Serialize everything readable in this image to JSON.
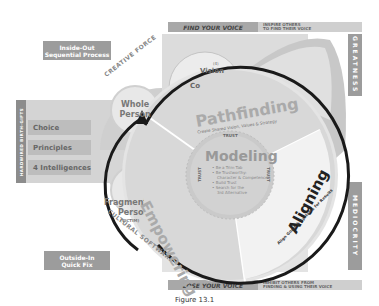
{
  "header": {
    "find_voice": "FIND YOUR VOICE",
    "inspire_line1": "INSPIRE OTHERS",
    "inspire_line2": "TO FIND THEIR VOICE"
  },
  "footer": {
    "lose_voice": "LOSE YOUR VOICE",
    "inhibit_line1": "INHIBIT OTHERS FROM",
    "inhibit_line2": "FINDING & USING THEIR VOICE",
    "caption": "Figure 13.1"
  },
  "left": {
    "inside_out_line1": "Inside-Out",
    "inside_out_line2": "Sequential Process",
    "outside_in_line1": "Outside-In",
    "outside_in_line2": "Quick Fix",
    "hardwired_label": "HARDWIRED BIRTH-GIFTS",
    "gifts": [
      "Choice",
      "Principles",
      "4 Intelligences"
    ],
    "creative_force": "CREATIVE FORCE",
    "cultural_software": "CULTURAL SOFTWARE",
    "whole_person_line1": "Whole",
    "whole_person_line2": "Person",
    "fragmented_line1": "Fragmented",
    "fragmented_line2": "Person",
    "fragmented_note": "(VICTIM)"
  },
  "right": {
    "greatness": "GREATNESS",
    "mediocrity": "MEDIOCRITY"
  },
  "wheel": {
    "vision": "Vision",
    "vision_prefix": "(4)",
    "conscience_partial": "Co",
    "pathfinding": "Pathfinding",
    "pathfinding_sub": "Create Shared Vision, Values & Strategy",
    "empowering": "Empowering",
    "aligning": "Aligning",
    "aligning_sub": "Align Goals & Systems for Results",
    "modeling": "Modeling",
    "trust": "TRUST",
    "modeling_bullets": [
      "Be a Trim Tab",
      "Be Trustworthy:",
      "Character & Competence",
      "Build Trust",
      "Search for the",
      "3rd Alternative"
    ]
  },
  "colors": {
    "box_gray": "#9c9c9c",
    "light_gray": "#d9d9d9",
    "mid_gray": "#bdbdbd",
    "arrow_black": "#1a1a1a"
  }
}
